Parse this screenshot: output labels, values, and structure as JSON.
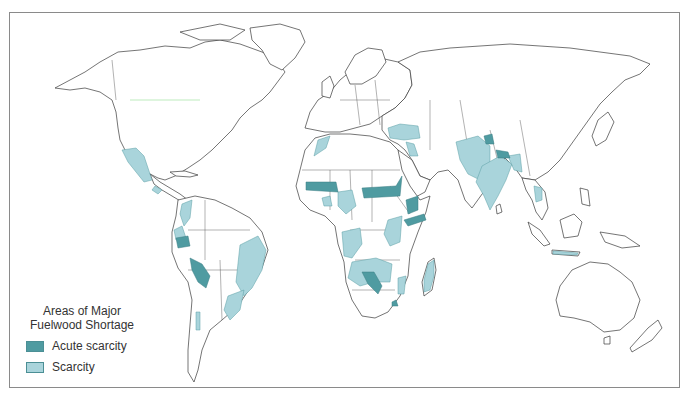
{
  "map": {
    "title": "World map of major fuelwood shortage areas",
    "colors": {
      "acute": "#4f9ba1",
      "scarcity": "#a9d4db",
      "land_stroke": "#3a3a3a",
      "frame": "#8a8a8a"
    }
  },
  "legend": {
    "title_line1": "Areas of Major",
    "title_line2": "Fuelwood Shortage",
    "items": [
      {
        "label": "Acute scarcity",
        "category": "acute"
      },
      {
        "label": "Scarcity",
        "category": "scarcity"
      }
    ]
  },
  "regions": {
    "acute": [
      "Sahel band (Mauritania–Mali)",
      "Sahel band (Niger–Chad–Sudan)",
      "Ethiopian highlands",
      "Horn of Africa / Kenya",
      "Namibia–Botswana",
      "Andes (Ecuador)",
      "Andes (Peru–Bolivia)",
      "Northern Pakistan",
      "Nepal / Himalaya foothills",
      "Lesotho"
    ],
    "scarcity": [
      "Mexico",
      "Central America",
      "Colombia–Venezuela Andes",
      "Eastern Brazil",
      "Southern Brazil / Uruguay",
      "Chile",
      "Morocco",
      "West Africa",
      "Central Africa",
      "East Africa",
      "Angola–Zambia",
      "Mozambique",
      "Madagascar",
      "Turkey",
      "Levant",
      "Iran–Afghanistan–Pakistan",
      "India",
      "Bangladesh",
      "Thailand",
      "Java"
    ]
  }
}
